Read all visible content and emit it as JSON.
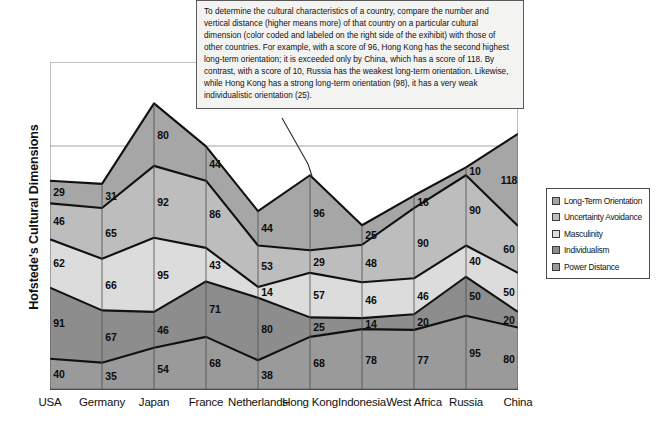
{
  "chart_data": {
    "type": "area",
    "title": "",
    "ylabel": "Hofstede's Cultural Dimensions",
    "xlabel": "",
    "stacked": true,
    "grid": true,
    "legend_position": "right",
    "ylim": [
      0,
      420
    ],
    "categories": [
      "USA",
      "Germany",
      "Japan",
      "France",
      "Netherlands",
      "Hong Kong",
      "Indonesia",
      "West Africa",
      "Russia",
      "China"
    ],
    "series": [
      {
        "name": "Power Distance",
        "color": "#9a9a9a",
        "values": [
          40,
          35,
          54,
          68,
          38,
          68,
          78,
          77,
          95,
          80
        ]
      },
      {
        "name": "Individualism",
        "color": "#8d8d8d",
        "values": [
          91,
          67,
          46,
          71,
          80,
          25,
          14,
          20,
          50,
          20
        ]
      },
      {
        "name": "Masculinity",
        "color": "#dcdcdc",
        "values": [
          62,
          66,
          95,
          43,
          14,
          57,
          46,
          46,
          40,
          50
        ]
      },
      {
        "name": "Uncertainty Avoidance",
        "color": "#bdbdbd",
        "values": [
          46,
          65,
          92,
          86,
          53,
          29,
          48,
          90,
          90,
          60
        ]
      },
      {
        "name": "Long-Term Orientation",
        "color": "#a6a6a6",
        "values": [
          29,
          31,
          80,
          44,
          44,
          96,
          25,
          16,
          10,
          118
        ]
      }
    ]
  },
  "annotation": {
    "text": "To determine the cultural characteristics of a country, compare the number and vertical distance (higher means more) of that country on a particular cultural dimension (color coded and labeled on the right side of the exihibit) with those of other countries.  For example, with a score of 96, Hong Kong has the second highest long-term orientation; it is exceeded only by China, which has a score of 118.  By contrast, with a score of 10, Russia has the weakest long-term orientation.  Likewise, while Hong Kong has a strong long-term orientation (98), it has a very weak individualistic orientation (25)."
  },
  "legend": {
    "items": [
      {
        "label": "Long-Term Orientation",
        "color": "#a6a6a6"
      },
      {
        "label": "Uncertainty Avoidance",
        "color": "#bdbdbd"
      },
      {
        "label": "Masculinity",
        "color": "#dcdcdc"
      },
      {
        "label": "Individualism",
        "color": "#8d8d8d"
      },
      {
        "label": "Power Distance",
        "color": "#9a9a9a"
      }
    ]
  },
  "colors": {
    "axis": "#6b6b6b",
    "grid": "#8a8a8a",
    "outline": "#111111",
    "text": "#111111"
  }
}
